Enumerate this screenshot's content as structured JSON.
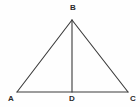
{
  "figure": {
    "type": "geometry-diagram",
    "shape": "isosceles-triangle-with-median",
    "background_color": "#fefefe",
    "stroke_color": "#3a3a3a",
    "label_color": "#2b2b2b",
    "stroke_width": 1,
    "width": 140,
    "height": 107,
    "vertices": [
      {
        "name": "B",
        "label": "B",
        "x": 72,
        "y": 20,
        "role": "apex"
      },
      {
        "name": "A",
        "label": "A",
        "x": 17,
        "y": 92,
        "role": "base-left"
      },
      {
        "name": "D",
        "label": "D",
        "x": 72,
        "y": 92,
        "role": "base-midpoint"
      },
      {
        "name": "C",
        "label": "C",
        "x": 128,
        "y": 92,
        "role": "base-right"
      }
    ],
    "segments": [
      {
        "name": "side-AB",
        "from": "A",
        "to": "B"
      },
      {
        "name": "side-BC",
        "from": "B",
        "to": "C"
      },
      {
        "name": "base-AC",
        "from": "A",
        "to": "C"
      },
      {
        "name": "median-BD",
        "from": "B",
        "to": "D"
      }
    ]
  }
}
